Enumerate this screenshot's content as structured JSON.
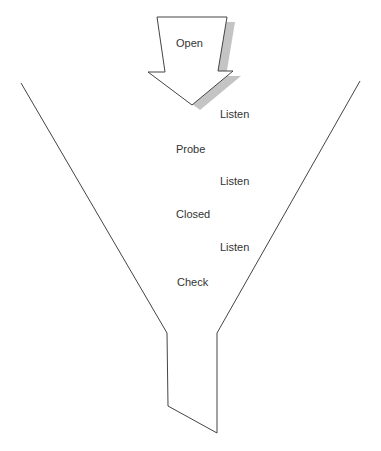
{
  "diagram": {
    "type": "funnel",
    "arrow_label": "Open",
    "stages": [
      {
        "id": "listen1",
        "label": "Listen",
        "x": 220,
        "y": 108
      },
      {
        "id": "probe",
        "label": "Probe",
        "x": 176,
        "y": 143
      },
      {
        "id": "listen2",
        "label": "Listen",
        "x": 220,
        "y": 175
      },
      {
        "id": "closed",
        "label": "Closed",
        "x": 176,
        "y": 208
      },
      {
        "id": "listen3",
        "label": "Listen",
        "x": 220,
        "y": 241
      },
      {
        "id": "check",
        "label": "Check",
        "x": 177,
        "y": 276
      }
    ],
    "colors": {
      "line": "#444444",
      "shadow": "#c4c4c4",
      "text": "#333333",
      "background": "#ffffff"
    }
  }
}
